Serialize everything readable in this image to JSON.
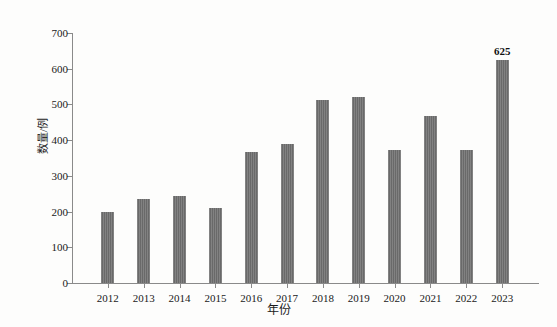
{
  "chart_data": {
    "type": "bar",
    "title": "",
    "xlabel": "年份",
    "ylabel": "数量/例",
    "categories": [
      "2012",
      "2013",
      "2014",
      "2015",
      "2016",
      "2017",
      "2018",
      "2019",
      "2020",
      "2021",
      "2022",
      "2023"
    ],
    "values": [
      200,
      235,
      243,
      210,
      368,
      388,
      513,
      520,
      372,
      468,
      373,
      625
    ],
    "data_labels": [
      null,
      null,
      null,
      null,
      null,
      null,
      null,
      null,
      null,
      null,
      null,
      "625"
    ],
    "ylim": [
      0,
      700
    ],
    "y_ticks": [
      "0",
      "100",
      "200",
      "300",
      "400",
      "500",
      "600",
      "700"
    ],
    "y_tick_values": [
      0,
      100,
      200,
      300,
      400,
      500,
      600,
      700
    ],
    "grid": false,
    "legend": null,
    "bar_color": "#6f6f6f",
    "axis_color": "#8a8a8a",
    "background_color": "#fdfdfc",
    "text_color": "#1a1a1a"
  }
}
